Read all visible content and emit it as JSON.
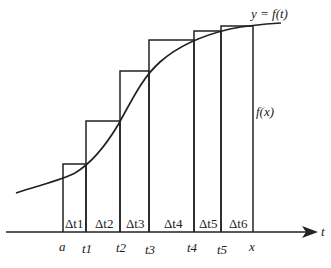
{
  "diagram": {
    "curve_label": "y = f(t)",
    "fx_label": "f(x)",
    "axis_label": "t",
    "delta_labels": [
      "Δt1",
      "Δt2",
      "Δt3",
      "Δt4",
      "Δt5",
      "Δt6"
    ],
    "tick_labels": [
      "a",
      "t1",
      "t2",
      "t3",
      "t4",
      "t5",
      "x"
    ],
    "colors": {
      "stroke": "#222222",
      "background": "#ffffff"
    }
  }
}
